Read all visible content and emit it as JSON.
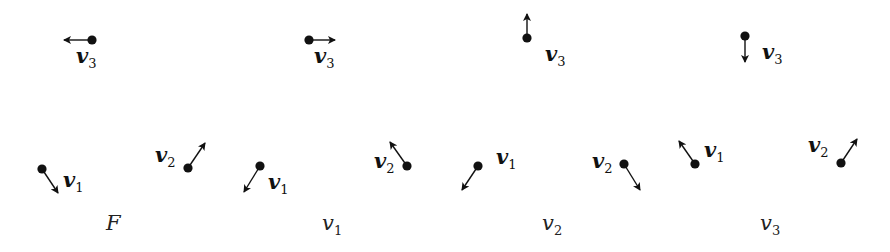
{
  "panels": [
    {
      "caption": {
        "main": "F",
        "sub": "",
        "x": 106,
        "y": 230
      },
      "vertices": [
        {
          "name": "v1",
          "label": "v",
          "sub": "1",
          "dot": [
            42,
            169
          ],
          "tip": [
            58,
            193
          ],
          "label_pos": [
            63,
            187
          ]
        },
        {
          "name": "v2",
          "label": "v",
          "sub": "2",
          "dot": [
            188,
            168
          ],
          "tip": [
            205,
            143
          ],
          "label_pos": [
            155,
            162
          ]
        },
        {
          "name": "v3",
          "label": "v",
          "sub": "3",
          "dot": [
            92,
            40
          ],
          "tip": [
            64,
            40
          ],
          "label_pos": [
            76,
            63
          ]
        }
      ]
    },
    {
      "caption": {
        "main": "v",
        "sub": "1",
        "x": 322,
        "y": 230
      },
      "vertices": [
        {
          "name": "v1",
          "label": "v",
          "sub": "1",
          "dot": [
            260,
            166
          ],
          "tip": [
            244,
            192
          ],
          "label_pos": [
            268,
            189
          ]
        },
        {
          "name": "v2",
          "label": "v",
          "sub": "2",
          "dot": [
            407,
            166
          ],
          "tip": [
            390,
            142
          ],
          "label_pos": [
            374,
            168
          ]
        },
        {
          "name": "v3",
          "label": "v",
          "sub": "3",
          "dot": [
            309,
            40
          ],
          "tip": [
            335,
            40
          ],
          "label_pos": [
            314,
            63
          ]
        }
      ]
    },
    {
      "caption": {
        "main": "v",
        "sub": "2",
        "x": 542,
        "y": 230
      },
      "vertices": [
        {
          "name": "v1",
          "label": "v",
          "sub": "1",
          "dot": [
            478,
            166
          ],
          "tip": [
            462,
            190
          ],
          "label_pos": [
            496,
            164
          ]
        },
        {
          "name": "v2",
          "label": "v",
          "sub": "2",
          "dot": [
            624,
            164
          ],
          "tip": [
            640,
            190
          ],
          "label_pos": [
            592,
            168
          ]
        },
        {
          "name": "v3",
          "label": "v",
          "sub": "3",
          "dot": [
            527,
            38
          ],
          "tip": [
            527,
            14
          ],
          "label_pos": [
            545,
            61
          ]
        }
      ]
    },
    {
      "caption": {
        "main": "v",
        "sub": "3",
        "x": 760,
        "y": 230
      },
      "vertices": [
        {
          "name": "v1",
          "label": "v",
          "sub": "1",
          "dot": [
            695,
            164
          ],
          "tip": [
            679,
            141
          ],
          "label_pos": [
            704,
            157
          ]
        },
        {
          "name": "v2",
          "label": "v",
          "sub": "2",
          "dot": [
            841,
            163
          ],
          "tip": [
            857,
            139
          ],
          "label_pos": [
            808,
            152
          ]
        },
        {
          "name": "v3",
          "label": "v",
          "sub": "3",
          "dot": [
            745,
            36
          ],
          "tip": [
            745,
            62
          ],
          "label_pos": [
            762,
            59
          ]
        }
      ]
    }
  ],
  "colors": {
    "ink": "#111111",
    "caption_ink": "#222222",
    "background": "#ffffff"
  }
}
